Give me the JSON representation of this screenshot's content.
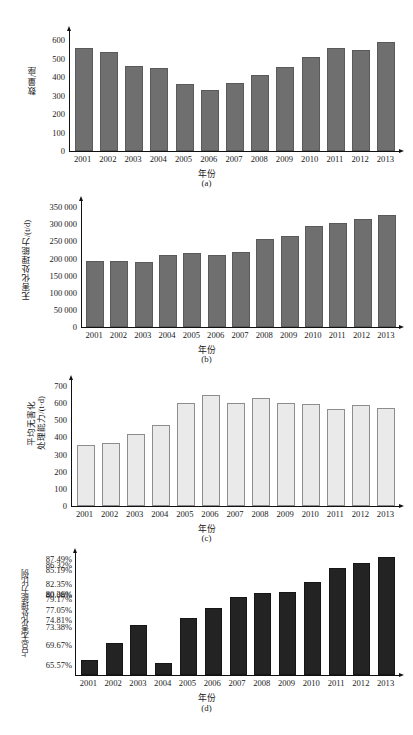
{
  "figure": {
    "years": [
      "2001",
      "2002",
      "2003",
      "2004",
      "2005",
      "2006",
      "2007",
      "2008",
      "2009",
      "2010",
      "2011",
      "2012",
      "2013"
    ],
    "xlabel": "年份"
  },
  "chart_data": [
    {
      "type": "bar",
      "panel": "a",
      "caption": "(a)",
      "title": "",
      "xlabel": "年份",
      "ylabel": "数量/座",
      "categories": [
        "2001",
        "2002",
        "2003",
        "2004",
        "2005",
        "2006",
        "2007",
        "2008",
        "2009",
        "2010",
        "2011",
        "2012",
        "2013"
      ],
      "values": [
        545,
        523,
        452,
        440,
        352,
        320,
        360,
        402,
        444,
        496,
        546,
        537,
        578
      ],
      "ylim": [
        0,
        650
      ],
      "yticks": [
        0,
        100,
        200,
        300,
        400,
        500,
        600
      ],
      "ytick_labels": [
        "0",
        "100",
        "200",
        "300",
        "400",
        "500",
        "600"
      ],
      "grid": false,
      "legend": "none",
      "bar_color": "#6f6f6f"
    },
    {
      "type": "bar",
      "panel": "b",
      "caption": "(b)",
      "title": "",
      "xlabel": "年份",
      "ylabel": "无害化处理能力/(t/d)",
      "categories": [
        "2001",
        "2002",
        "2003",
        "2004",
        "2005",
        "2006",
        "2007",
        "2008",
        "2009",
        "2010",
        "2011",
        "2012",
        "2013"
      ],
      "values": [
        188000,
        186000,
        184000,
        204000,
        210000,
        205000,
        213000,
        251000,
        259000,
        288000,
        299000,
        309000,
        321000
      ],
      "ylim": [
        0,
        368000
      ],
      "yticks": [
        0,
        50000,
        100000,
        150000,
        200000,
        250000,
        300000,
        350000
      ],
      "ytick_labels": [
        "0",
        "50 000",
        "100 000",
        "150 000",
        "200 000",
        "250 000",
        "300 000",
        "350 000"
      ],
      "grid": false,
      "legend": "none",
      "bar_color": "#6f6f6f"
    },
    {
      "type": "bar",
      "panel": "c",
      "caption": "(c)",
      "title": "",
      "xlabel": "年份",
      "ylabel": "平均无害化\n处理能力/(t·d)",
      "categories": [
        "2001",
        "2002",
        "2003",
        "2004",
        "2005",
        "2006",
        "2007",
        "2008",
        "2009",
        "2010",
        "2011",
        "2012",
        "2013"
      ],
      "values": [
        345,
        356,
        407,
        462,
        592,
        638,
        589,
        621,
        587,
        581,
        552,
        578,
        560
      ],
      "ylim": [
        0,
        735
      ],
      "yticks": [
        0,
        100,
        200,
        300,
        400,
        500,
        600,
        700
      ],
      "ytick_labels": [
        "0",
        "100",
        "200",
        "300",
        "400",
        "500",
        "600",
        "700"
      ],
      "grid": false,
      "legend": "none",
      "bar_color": "#eaeaea"
    },
    {
      "type": "bar",
      "panel": "d",
      "caption": "(d)",
      "title": "",
      "xlabel": "年份",
      "ylabel": "占总无害化处理能力比例",
      "categories": [
        "2001",
        "2002",
        "2003",
        "2004",
        "2005",
        "2006",
        "2007",
        "2008",
        "2009",
        "2010",
        "2011",
        "2012",
        "2013"
      ],
      "values": [
        66.3,
        69.67,
        73.38,
        65.57,
        74.81,
        77.05,
        79.17,
        80.08,
        80.36,
        82.35,
        85.19,
        86.32,
        87.49
      ],
      "ylim": [
        63.5,
        89.0
      ],
      "ytick_labels": [
        "87.49%",
        "86.32%",
        "85.19%",
        "82.35%",
        "80.36%",
        "80.08%",
        "79.17%",
        "77.05%",
        "74.81%",
        "73.38%",
        "69.67%",
        "65.57%"
      ],
      "ytick_values": [
        87.49,
        86.32,
        85.19,
        82.35,
        80.36,
        80.08,
        79.17,
        77.05,
        74.81,
        73.38,
        69.67,
        65.57
      ],
      "grid": false,
      "legend": "none",
      "bar_color": "#232323"
    }
  ]
}
